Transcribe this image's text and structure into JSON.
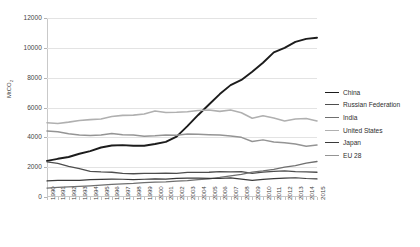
{
  "chart_data": {
    "type": "line",
    "title": "",
    "xlabel": "",
    "ylabel": "MtCO2",
    "ylabel_base": "MtCO",
    "ylabel_sub": "2",
    "ylim": [
      0,
      12000
    ],
    "ytick_values": [
      0,
      2000,
      4000,
      6000,
      8000,
      10000,
      12000
    ],
    "ytick_labels": [
      "0",
      "2000",
      "4000",
      "6000",
      "8000",
      "10000",
      "12000"
    ],
    "grid": "horizontal",
    "legend_position": "right",
    "categories": [
      "1990",
      "1991",
      "1992",
      "1993",
      "1994",
      "1995",
      "1996",
      "1997",
      "1998",
      "1999",
      "2000",
      "2001",
      "2002",
      "2003",
      "2004",
      "2005",
      "2006",
      "2007",
      "2008",
      "2009",
      "2010",
      "2011",
      "2012",
      "2013",
      "2014",
      "2015"
    ],
    "series": [
      {
        "name": "China",
        "color": "#1c1c1c",
        "width": 1.9,
        "values": [
          2420,
          2560,
          2680,
          2900,
          3080,
          3320,
          3450,
          3480,
          3440,
          3440,
          3550,
          3700,
          4050,
          4750,
          5500,
          6200,
          6900,
          7500,
          7850,
          8400,
          9000,
          9700,
          10000,
          10400,
          10600,
          10680
        ]
      },
      {
        "name": "Russian Federation",
        "color": "#4e4e4e",
        "width": 1.3,
        "values": [
          2360,
          2250,
          2050,
          1900,
          1720,
          1680,
          1660,
          1580,
          1560,
          1580,
          1590,
          1600,
          1590,
          1650,
          1650,
          1660,
          1700,
          1680,
          1700,
          1580,
          1670,
          1720,
          1750,
          1700,
          1680,
          1660
        ]
      },
      {
        "name": "India",
        "color": "#6f6f6f",
        "width": 1.3,
        "values": [
          600,
          640,
          680,
          710,
          750,
          800,
          840,
          880,
          910,
          960,
          1000,
          1020,
          1060,
          1100,
          1170,
          1220,
          1310,
          1420,
          1520,
          1670,
          1750,
          1850,
          2000,
          2100,
          2270,
          2380
        ]
      },
      {
        "name": "United States",
        "color": "#b0b0b0",
        "width": 1.6,
        "values": [
          4980,
          4930,
          5020,
          5130,
          5190,
          5230,
          5400,
          5470,
          5490,
          5560,
          5760,
          5660,
          5680,
          5720,
          5800,
          5830,
          5740,
          5830,
          5650,
          5280,
          5450,
          5300,
          5100,
          5230,
          5260,
          5100
        ]
      },
      {
        "name": "Japan",
        "color": "#3a3a3a",
        "width": 1.2,
        "values": [
          1080,
          1110,
          1120,
          1110,
          1170,
          1180,
          1200,
          1190,
          1160,
          1190,
          1220,
          1200,
          1250,
          1270,
          1260,
          1250,
          1240,
          1280,
          1200,
          1110,
          1180,
          1230,
          1270,
          1290,
          1240,
          1210
        ]
      },
      {
        "name": "EU 28",
        "color": "#949494",
        "width": 1.5,
        "values": [
          4420,
          4380,
          4240,
          4160,
          4130,
          4160,
          4250,
          4170,
          4160,
          4080,
          4100,
          4160,
          4140,
          4220,
          4210,
          4180,
          4150,
          4090,
          4000,
          3720,
          3830,
          3690,
          3640,
          3550,
          3400,
          3480
        ]
      }
    ]
  }
}
